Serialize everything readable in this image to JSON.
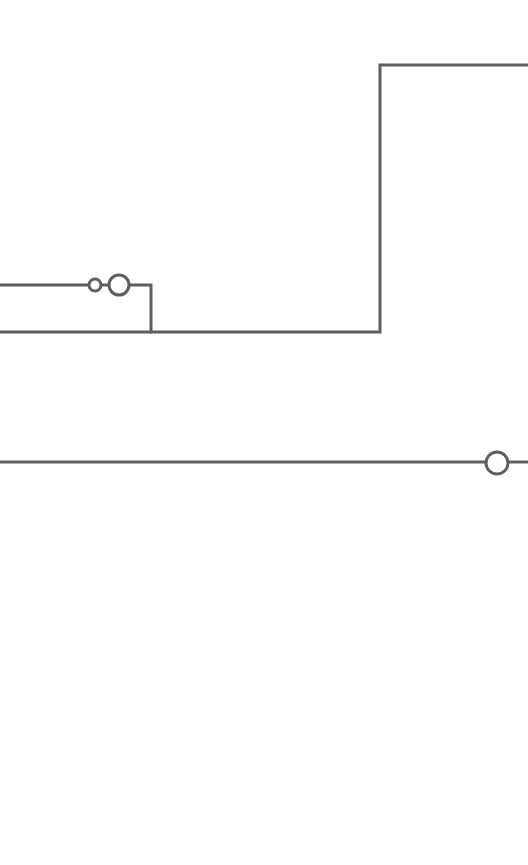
{
  "diagram": {
    "type": "line-schematic",
    "background": "#ffffff",
    "stroke_color": "#5f5f5f",
    "stroke_width": 3,
    "canvas": {
      "width": 528,
      "height": 865
    },
    "wires": [
      {
        "id": "upper-branch",
        "points": [
          [
            0,
            285
          ],
          [
            88,
            285
          ]
        ]
      },
      {
        "id": "upper-branch-link",
        "points": [
          [
            101,
            285
          ],
          [
            109,
            285
          ]
        ]
      },
      {
        "id": "upper-branch-tail",
        "points": [
          [
            130,
            285
          ],
          [
            151,
            285
          ],
          [
            151,
            332
          ]
        ]
      },
      {
        "id": "main-rail",
        "points": [
          [
            0,
            332
          ],
          [
            380,
            332
          ],
          [
            380,
            65
          ],
          [
            528,
            65
          ]
        ]
      },
      {
        "id": "lower-rail",
        "points": [
          [
            0,
            462
          ],
          [
            485,
            462
          ]
        ]
      },
      {
        "id": "lower-rail-tail",
        "points": [
          [
            509,
            462
          ],
          [
            528,
            462
          ]
        ]
      }
    ],
    "nodes": [
      {
        "id": "small-contact",
        "cx": 95,
        "cy": 285,
        "r": 6
      },
      {
        "id": "large-contact-upper",
        "cx": 119,
        "cy": 285,
        "r": 10
      },
      {
        "id": "large-contact-lower",
        "cx": 497,
        "cy": 463,
        "r": 11
      }
    ]
  }
}
